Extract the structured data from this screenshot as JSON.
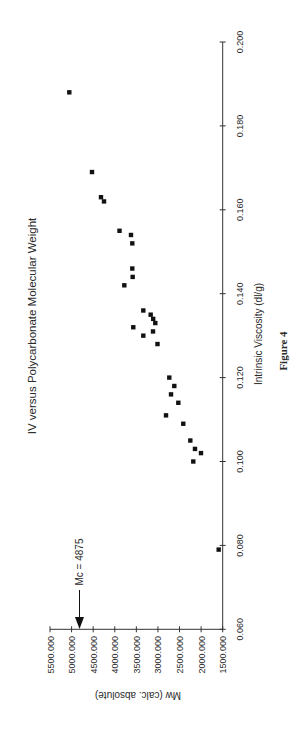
{
  "figure": {
    "caption": "Figure 4",
    "orientation": "rotated-90-ccw"
  },
  "chart_data": {
    "type": "scatter",
    "title": "IV versus Polycarbonate Molecular Weight",
    "xlabel": "Intrinsic Viscosity (dl/g)",
    "ylabel": "Mw (calc. absolute)",
    "xlim": [
      0.06,
      0.2
    ],
    "ylim": [
      1500000,
      5500000
    ],
    "x_ticks": [
      "0.060",
      "0.080",
      "0.100",
      "0.120",
      "0.140",
      "0.160",
      "0.180",
      "0.200"
    ],
    "y_ticks": [
      "1500.000",
      "2000.000",
      "2500.000",
      "3000.000",
      "3500.000",
      "4000.000",
      "4500.000",
      "5000.000",
      "5500.000"
    ],
    "grid": false,
    "legend": null,
    "marker": "square",
    "marker_color": "#111111",
    "annotations": [
      {
        "text": "Mc = 4875",
        "type": "arrow",
        "points_to_y": 4875000
      }
    ],
    "series": [
      {
        "name": "Polycarbonate samples",
        "points": [
          {
            "x": 0.188,
            "y": 5053000
          },
          {
            "x": 0.169,
            "y": 4527000
          },
          {
            "x": 0.163,
            "y": 4319000
          },
          {
            "x": 0.162,
            "y": 4249000
          },
          {
            "x": 0.155,
            "y": 3890000
          },
          {
            "x": 0.154,
            "y": 3624000
          },
          {
            "x": 0.152,
            "y": 3594000
          },
          {
            "x": 0.146,
            "y": 3594000
          },
          {
            "x": 0.144,
            "y": 3585000
          },
          {
            "x": 0.142,
            "y": 3779000
          },
          {
            "x": 0.136,
            "y": 3339000
          },
          {
            "x": 0.135,
            "y": 3168000
          },
          {
            "x": 0.134,
            "y": 3110000
          },
          {
            "x": 0.133,
            "y": 3061000
          },
          {
            "x": 0.132,
            "y": 3571000
          },
          {
            "x": 0.131,
            "y": 3114000
          },
          {
            "x": 0.13,
            "y": 3339000
          },
          {
            "x": 0.128,
            "y": 3010000
          },
          {
            "x": 0.12,
            "y": 2737000
          },
          {
            "x": 0.118,
            "y": 2621000
          },
          {
            "x": 0.116,
            "y": 2697000
          },
          {
            "x": 0.114,
            "y": 2528000
          },
          {
            "x": 0.111,
            "y": 2813000
          },
          {
            "x": 0.109,
            "y": 2413000
          },
          {
            "x": 0.105,
            "y": 2250000
          },
          {
            "x": 0.103,
            "y": 2142000
          },
          {
            "x": 0.102,
            "y": 2003000
          },
          {
            "x": 0.1,
            "y": 2181000
          },
          {
            "x": 0.079,
            "y": 1593000
          }
        ]
      }
    ]
  },
  "colors": {
    "axis": "#333333",
    "marker": "#111111",
    "text": "#2a2a2a",
    "background": "#ffffff"
  }
}
